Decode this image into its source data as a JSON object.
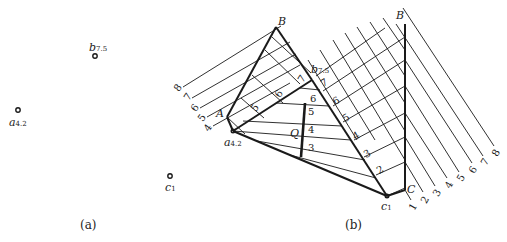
{
  "panel_a": {
    "caption": "(a)",
    "points": [
      {
        "name": "b",
        "sub": "7.5"
      },
      {
        "name": "a",
        "sub": "4.2"
      },
      {
        "name": "c",
        "sub": "1"
      }
    ]
  },
  "panel_b": {
    "caption": "(b)",
    "labels": {
      "B_left": "B",
      "B_right": "B",
      "A": "A",
      "C": "C",
      "Q": "Q",
      "a": "a",
      "a_sub": "4.2",
      "b": "b",
      "b_sub": "7.5",
      "c": "c",
      "c_sub": "1"
    },
    "left_scale": [
      "4",
      "5",
      "6",
      "7",
      "8"
    ],
    "right_scale": [
      "1",
      "2",
      "3",
      "4",
      "5",
      "6",
      "7",
      "8"
    ],
    "inner_left": [
      "5",
      "6",
      "7"
    ],
    "contour_labels": [
      "3",
      "4",
      "5",
      "6"
    ],
    "inner_right": [
      "2",
      "3",
      "4",
      "5",
      "6",
      "7"
    ]
  },
  "colors": {
    "ink": "#1a1a1a",
    "background": "#ffffff"
  }
}
